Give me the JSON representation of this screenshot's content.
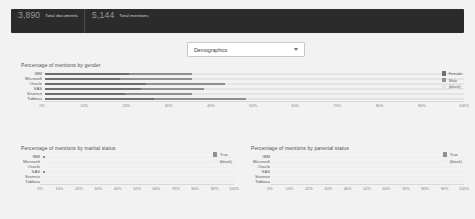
{
  "header": {
    "kpis": [
      {
        "value": "3,890",
        "label": "Total documents"
      },
      {
        "value": "5,144",
        "label": "Total mentions"
      }
    ]
  },
  "filter": {
    "selected": "Demographics",
    "options": [
      "Demographics"
    ],
    "caret_icon": "chevron-down-icon"
  },
  "colors": {
    "header_bg": "#2b2b2b",
    "page_bg": "#f2f2f2",
    "plot_bg": "#fbfbfb",
    "series_primary": "#6e6e6e",
    "series_secondary": "#8f8f8f",
    "series_blank": "#e4e4e4",
    "gridline": "#ececec",
    "text": "#4d4d4d"
  },
  "chart_data": [
    {
      "id": "gender",
      "type": "bar",
      "orientation": "horizontal",
      "stacked": true,
      "title": "Percentage of mentions by gender",
      "xlabel": "",
      "ylabel": "",
      "xlim": [
        0,
        100
      ],
      "xticks": [
        "0%",
        "10%",
        "20%",
        "30%",
        "40%",
        "50%",
        "60%",
        "70%",
        "80%",
        "90%",
        "100%"
      ],
      "grid": true,
      "legend_position": "right",
      "categories": [
        "IBM",
        "Microsoft",
        "Oracle",
        "SAS",
        "Sisense",
        "Tableau"
      ],
      "series": [
        {
          "name": "Female",
          "color": "#6e6e6e",
          "values": [
            20,
            18,
            24,
            23,
            19,
            26
          ]
        },
        {
          "name": "Male",
          "color": "#8f8f8f",
          "values": [
            15,
            17,
            19,
            15,
            16,
            22
          ]
        },
        {
          "name": "(blank)",
          "color": "#e4e4e4",
          "values": [
            65,
            65,
            57,
            62,
            65,
            52
          ]
        }
      ]
    },
    {
      "id": "marital",
      "type": "bar",
      "orientation": "horizontal",
      "stacked": true,
      "title": "Percentage of mentions by marital status",
      "xlabel": "",
      "ylabel": "",
      "xlim": [
        0,
        100
      ],
      "xticks": [
        "0%",
        "10%",
        "20%",
        "30%",
        "40%",
        "50%",
        "60%",
        "70%",
        "80%",
        "90%",
        "100%"
      ],
      "grid": true,
      "legend_position": "right",
      "categories": [
        "IBM",
        "Microsoft",
        "Oracle",
        "SAS",
        "Sisense",
        "Tableau"
      ],
      "series": [
        {
          "name": "True",
          "color": "#8f8f8f",
          "values": [
            1,
            0,
            0,
            1,
            0,
            0
          ]
        },
        {
          "name": "(blank)",
          "color": "#efefef",
          "values": [
            99,
            100,
            100,
            99,
            100,
            100
          ]
        }
      ]
    },
    {
      "id": "parental",
      "type": "bar",
      "orientation": "horizontal",
      "stacked": true,
      "title": "Percentage of mentions by parental status",
      "xlabel": "",
      "ylabel": "",
      "xlim": [
        0,
        100
      ],
      "xticks": [
        "0%",
        "10%",
        "20%",
        "30%",
        "40%",
        "50%",
        "60%",
        "70%",
        "80%",
        "90%",
        "100%"
      ],
      "grid": true,
      "legend_position": "right",
      "categories": [
        "IBM",
        "Microsoft",
        "Oracle",
        "SAS",
        "Sisense",
        "Tableau"
      ],
      "series": [
        {
          "name": "True",
          "color": "#8f8f8f",
          "values": [
            0,
            0,
            0,
            0,
            0,
            0
          ]
        },
        {
          "name": "(blank)",
          "color": "#efefef",
          "values": [
            100,
            100,
            100,
            100,
            100,
            100
          ]
        }
      ]
    }
  ]
}
